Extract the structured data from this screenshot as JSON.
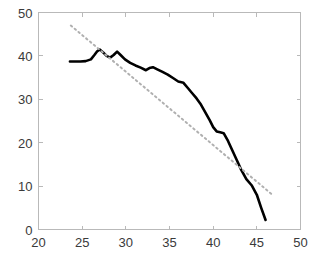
{
  "chart_data": {
    "type": "line",
    "title": "",
    "subtitle": "",
    "xlabel": "",
    "ylabel": "",
    "xlim": [
      20,
      50
    ],
    "ylim": [
      0,
      50
    ],
    "xticks": [
      20,
      25,
      30,
      35,
      40,
      45,
      50
    ],
    "yticks": [
      0,
      10,
      20,
      30,
      40,
      50
    ],
    "xtick_labels": [
      "20",
      "25",
      "30",
      "35",
      "40",
      "45",
      "50"
    ],
    "ytick_labels": [
      "0",
      "10",
      "20",
      "30",
      "40",
      "50"
    ],
    "grid": false,
    "legend": null,
    "legend_position": "none",
    "annotations": [],
    "series": [
      {
        "name": "data",
        "style": "solid",
        "color": "#000000",
        "linewidth": 2.6,
        "x": [
          23.6,
          24.2,
          24.8,
          25.4,
          26.0,
          26.4,
          26.7,
          27.0,
          27.4,
          27.8,
          28.2,
          28.6,
          29.0,
          29.4,
          29.9,
          30.5,
          31.1,
          31.7,
          32.3,
          32.7,
          33.1,
          33.6,
          34.2,
          34.8,
          35.4,
          36.0,
          36.6,
          37.1,
          37.6,
          38.1,
          38.6,
          39.1,
          39.6,
          40.0,
          40.4,
          40.8,
          41.2,
          41.7,
          42.2,
          42.7,
          43.2,
          43.8,
          44.4,
          45.0,
          45.5,
          46.0
        ],
        "y": [
          38.7,
          38.7,
          38.7,
          38.8,
          39.2,
          40.2,
          41.0,
          41.5,
          40.8,
          40.0,
          39.6,
          40.2,
          41.0,
          40.2,
          39.2,
          38.4,
          37.8,
          37.3,
          36.7,
          37.2,
          37.4,
          36.9,
          36.3,
          35.7,
          34.9,
          34.1,
          33.8,
          32.6,
          31.4,
          30.2,
          28.8,
          27.0,
          25.2,
          23.6,
          22.6,
          22.4,
          22.2,
          20.4,
          18.2,
          16.0,
          13.8,
          11.6,
          10.2,
          8.0,
          5.0,
          2.2
        ]
      },
      {
        "name": "trend",
        "style": "dotted",
        "color": "#b0b0b0",
        "linewidth": 2,
        "x": [
          23.7,
          46.9
        ],
        "y": [
          47.0,
          7.8
        ]
      }
    ]
  },
  "axes": {
    "box_color": "#b9b9b9",
    "tick_color": "#b9b9b9",
    "label_color": "#3a3a3a",
    "background": "#ffffff"
  }
}
